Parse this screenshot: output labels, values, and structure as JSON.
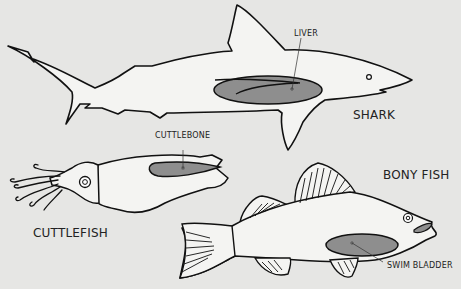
{
  "diagram": {
    "animals": [
      {
        "name": "SHARK",
        "organ": "LIVER"
      },
      {
        "name": "CUTTLEFISH",
        "organ": "CUTTLEBONE"
      },
      {
        "name": "BONY FISH",
        "organ": "SWIM BLADDER"
      }
    ],
    "labels": {
      "shark": "SHARK",
      "liver": "LIVER",
      "cuttlefish": "CUTTLEFISH",
      "cuttlebone": "CUTTLEBONE",
      "bony_fish": "BONY FISH",
      "swim_bladder": "SWIM BLADDER"
    },
    "colors": {
      "background": "#e6e6e4",
      "body_fill": "#f4f4f2",
      "organ_fill": "#8e8e8e",
      "outline": "#111111"
    }
  }
}
